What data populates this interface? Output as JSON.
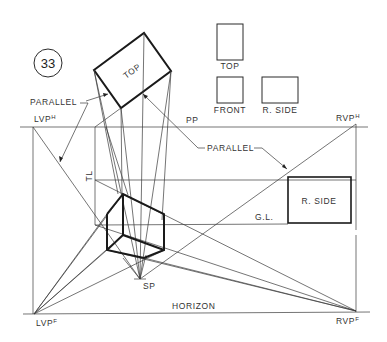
{
  "figure": {
    "number": "33",
    "labels": {
      "top_view_rotated": "TOP",
      "parallel_left": "PARALLEL",
      "parallel_right": "PARALLEL",
      "lvph_base": "LVP",
      "lvph_sup": "H",
      "rvph_base": "RVP",
      "rvph_sup": "H",
      "pp": "PP",
      "tl": "TL",
      "gl": "G.L.",
      "sp": "SP",
      "horizon": "HORIZON",
      "lvpf_base": "LVP",
      "lvpf_sup": "F",
      "rvpf_base": "RVP",
      "rvpf_sup": "F",
      "r_side_large": "R. SIDE"
    },
    "orthographic_views": {
      "top": "TOP",
      "front": "FRONT",
      "right_side": "R. SIDE"
    },
    "colors": {
      "line": "#2a2a2a",
      "background": "#ffffff"
    }
  }
}
